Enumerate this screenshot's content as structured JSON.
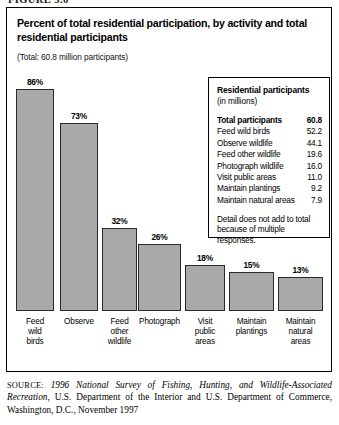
{
  "figure": {
    "caption_cutoff": "FIGURE 3.6"
  },
  "chart_title": "Percent of total residential participation, by activity and total residential participants",
  "chart_subtitle": "(Total: 60.8 million participants)",
  "legend": {
    "heading": "Residential participants",
    "units": "(in millions)",
    "rows": [
      {
        "label": "Total participants",
        "value": "60.8",
        "bold": true
      },
      {
        "label": "Feed wild birds",
        "value": "52.2",
        "bold": false
      },
      {
        "label": "Observe wildlife",
        "value": "44.1",
        "bold": false
      },
      {
        "label": "Feed other wildlife",
        "value": "19.6",
        "bold": false
      },
      {
        "label": "Photograph wildlife",
        "value": "16.0",
        "bold": false
      },
      {
        "label": "Visit public areas",
        "value": "11.0",
        "bold": false
      },
      {
        "label": "Maintain plantings",
        "value": "9.2",
        "bold": false
      },
      {
        "label": "Maintain natural areas",
        "value": "7.9",
        "bold": false
      }
    ],
    "note": "Detail does not add to total because of multiple responses."
  },
  "source": {
    "label": "SOURCE:",
    "italic_part": "1996 National Survey of Fishing, Hunting, and Wildlife-Associated Recreation",
    "rest": ", U.S. Department of the Interior and U.S. Department of Commerce, Washington, D.C., November 1997"
  },
  "colors": {
    "bar_fill": "#a9a9a9",
    "bar_stroke": "#2a2a2a",
    "frame": "#000000",
    "text": "#000000"
  },
  "chart_data": {
    "type": "bar",
    "title": "Percent of total residential participation, by activity and total residential participants",
    "subtitle": "(Total: 60.8 million participants)",
    "xlabel": "",
    "ylabel": "Percent of total residential participation",
    "ylim": [
      0,
      100
    ],
    "grid": false,
    "legend_position": "none",
    "categories": [
      "Feed wild birds",
      "Observe",
      "Feed other wildlife",
      "Photograph",
      "Visit public areas",
      "Maintain plantings",
      "Maintain natural areas"
    ],
    "category_lines": [
      [
        "Feed",
        "wild",
        "birds"
      ],
      [
        "Observe"
      ],
      [
        "Feed",
        "other",
        "wildlife"
      ],
      [
        "Photograph"
      ],
      [
        "Visit",
        "public",
        "areas"
      ],
      [
        "Maintain",
        "plantings"
      ],
      [
        "Maintain",
        "natural",
        "areas"
      ]
    ],
    "values": [
      86,
      73,
      32,
      26,
      18,
      15,
      13
    ],
    "value_labels": [
      "86%",
      "73%",
      "32%",
      "26%",
      "18%",
      "15%",
      "13%"
    ],
    "millions": [
      52.2,
      44.1,
      19.6,
      16.0,
      11.0,
      9.2,
      7.9
    ],
    "total_participants_millions": 60.8
  }
}
